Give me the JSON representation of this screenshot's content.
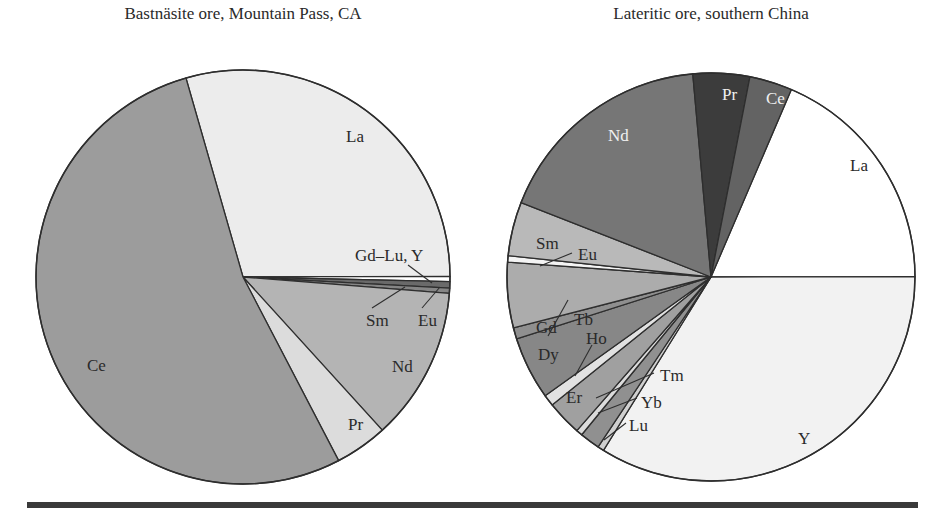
{
  "chart_data": [
    {
      "type": "pie",
      "title": "Bastnäsite ore, Mountain Pass, CA",
      "center": [
        243,
        277
      ],
      "radius": 207,
      "start_angle_deg": -106,
      "slices": [
        {
          "label": "La",
          "value": 29.4,
          "color": "#ececec",
          "label_pos": [
            346,
            142
          ]
        },
        {
          "label": "Gd–Lu, Y",
          "value": 0.4,
          "color": "#ffffff",
          "label_pos": [
            355,
            261
          ],
          "leader": [
            [
              408,
              265
            ],
            [
              432,
              283
            ]
          ]
        },
        {
          "label": "Sm",
          "value": 0.5,
          "color": "#6a6a6a",
          "label_pos": [
            366,
            326
          ],
          "leader": [
            [
              372,
              308
            ],
            [
              405,
              287
            ]
          ]
        },
        {
          "label": "Eu",
          "value": 0.4,
          "color": "#858585",
          "label_pos": [
            418,
            326
          ],
          "leader": [
            [
              422,
              308
            ],
            [
              440,
              287
            ]
          ]
        },
        {
          "label": "Nd",
          "value": 12.0,
          "color": "#b4b4b4",
          "label_pos": [
            392,
            372
          ]
        },
        {
          "label": "Pr",
          "value": 4.1,
          "color": "#dcdcdc",
          "label_pos": [
            348,
            430
          ]
        },
        {
          "label": "Ce",
          "value": 53.2,
          "color": "#9c9c9c",
          "label_pos": [
            87,
            371
          ]
        }
      ]
    },
    {
      "type": "pie",
      "title": "Lateritic ore, southern China",
      "center": [
        711,
        277
      ],
      "radius": 204,
      "start_angle_deg": -66.8,
      "slices": [
        {
          "label": "Y",
          "value": 34.0,
          "color": "#f2f2f2",
          "label_pos": [
            798,
            444
          ]
        },
        {
          "label": "La",
          "value": 18.6,
          "color": "#ffffff",
          "label_pos": [
            850,
            171
          ]
        },
        {
          "label": "Ce",
          "value": 3.4,
          "color": "#636363",
          "label_pos": [
            766,
            104
          ],
          "light": true
        },
        {
          "label": "Pr",
          "value": 4.5,
          "color": "#3c3c3c",
          "label_pos": [
            722,
            100
          ],
          "light": true
        },
        {
          "label": "Nd",
          "value": 17.7,
          "color": "#767676",
          "label_pos": [
            608,
            141
          ],
          "light": true
        },
        {
          "label": "Sm",
          "value": 4.3,
          "color": "#b9b9b9",
          "label_pos": [
            536,
            249
          ]
        },
        {
          "label": "Eu",
          "value": 0.5,
          "color": "#f4f4f4",
          "label_pos": [
            578,
            260
          ],
          "leader": [
            [
              540,
              266
            ],
            [
              572,
              253
            ]
          ]
        },
        {
          "label": "Gd",
          "value": 5.2,
          "color": "#acacac",
          "label_pos": [
            536,
            333
          ]
        },
        {
          "label": "Tb",
          "value": 0.9,
          "color": "#8f8f8f",
          "label_pos": [
            574,
            325
          ],
          "leader": [
            [
              548,
              336
            ],
            [
              568,
              300
            ]
          ]
        },
        {
          "label": "Dy",
          "value": 5.0,
          "color": "#878787",
          "label_pos": [
            538,
            360
          ]
        },
        {
          "label": "Ho",
          "value": 0.9,
          "color": "#e2e2e2",
          "label_pos": [
            586,
            344
          ],
          "leader": [
            [
              575,
              376
            ],
            [
              592,
              345
            ]
          ]
        },
        {
          "label": "Er",
          "value": 2.8,
          "color": "#a0a0a0",
          "label_pos": [
            566,
            403
          ]
        },
        {
          "label": "Tm",
          "value": 0.5,
          "color": "#dcdcdc",
          "label_pos": [
            660,
            381
          ],
          "leader": [
            [
              596,
              398
            ],
            [
              654,
              373
            ]
          ]
        },
        {
          "label": "Yb",
          "value": 1.6,
          "color": "#909090",
          "label_pos": [
            641,
            408
          ],
          "leader": [
            [
              598,
              413
            ],
            [
              637,
              398
            ]
          ]
        },
        {
          "label": "Lu",
          "value": 0.5,
          "color": "#d0d0d0",
          "label_pos": [
            629,
            431
          ],
          "leader": [
            [
              604,
              440
            ],
            [
              626,
              423
            ]
          ]
        }
      ]
    }
  ],
  "rule": {
    "color": "#3a3a3a"
  }
}
